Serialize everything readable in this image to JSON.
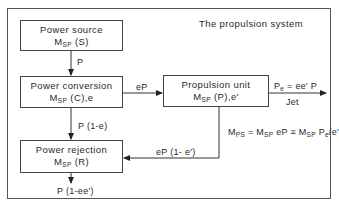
{
  "diagram": {
    "title": "The propulsion system",
    "boxes": {
      "power_source": {
        "title": "Power source",
        "mass_base": "M",
        "mass_sub": "SP",
        "mass_rest": " (S)"
      },
      "power_conversion": {
        "title": "Power conversion",
        "mass_base": "M",
        "mass_sub": "SP",
        "mass_rest": " (C),e"
      },
      "propulsion_unit": {
        "title": "Propulsion unit",
        "mass_base": "M",
        "mass_sub": "SP",
        "mass_rest": " (P),e'"
      },
      "power_rejection": {
        "title": "Power rejection",
        "mass_base": "M",
        "mass_sub": "SP",
        "mass_rest": " (R)"
      }
    },
    "flows": {
      "source_to_conversion": "P",
      "conversion_to_propulsion": "eP",
      "conversion_to_rejection": "P (1-e)",
      "propulsion_to_rejection": "eP (1- e')",
      "rejection_out": "P (1-ee')",
      "jet_power_base": "P",
      "jet_power_sub": "e",
      "jet_power_rest": " = ee' P",
      "jet_label": "Jet"
    },
    "equation": {
      "lhs_base": "M",
      "lhs_sub": "PS",
      "eq1": " = M",
      "eq1_sub": "SP",
      "mid": " eP ≡ M",
      "mid_sub": "SP",
      "rhs_base": " P",
      "rhs_sub": "e",
      "rhs_rest": "/e'"
    }
  }
}
